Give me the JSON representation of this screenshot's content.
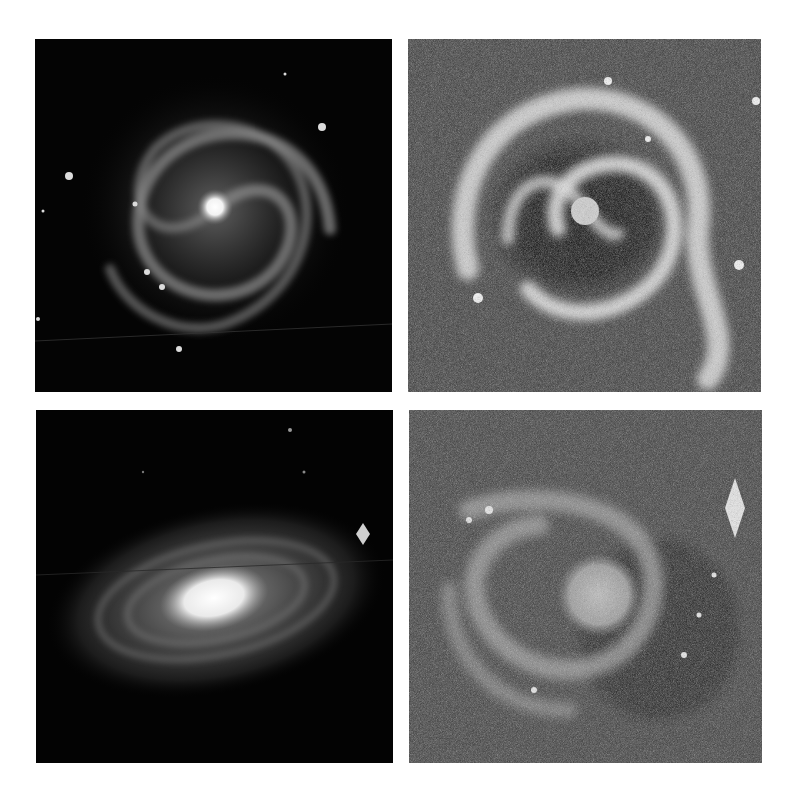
{
  "figure": {
    "layout": "2x2 grid of grayscale galaxy photographs",
    "background": "#ffffff",
    "panels": [
      {
        "position": "top-left",
        "subject": "face-on barred spiral galaxy, bright core, dark sky background",
        "style": "dark background"
      },
      {
        "position": "top-right",
        "subject": "face-on grand-design spiral galaxy with ring-like arms, high-contrast grainy",
        "style": "grainy grey background"
      },
      {
        "position": "bottom-left",
        "subject": "inclined spiral galaxy with bright elongated bulge, dark sky background, bright star at right",
        "style": "dark background"
      },
      {
        "position": "bottom-right",
        "subject": "spiral galaxy with knotty arms, high-contrast grainy, bright diffraction star at upper right",
        "style": "grainy grey background"
      }
    ]
  }
}
